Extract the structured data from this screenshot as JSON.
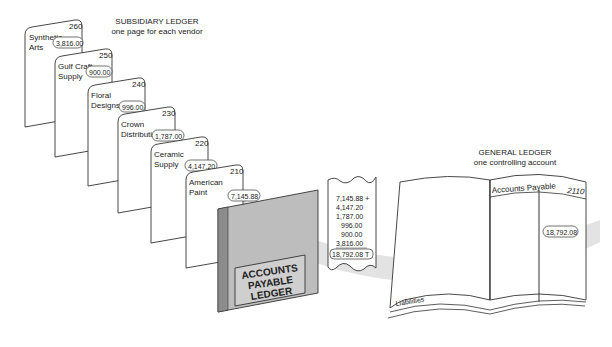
{
  "subsidiary_ledger": {
    "title": "SUBSIDIARY LEDGER",
    "subtitle": "one page for each vendor",
    "pages": [
      {
        "line1": "Synthetic",
        "line2": "Arts",
        "number": "260",
        "amount": "3,816.00"
      },
      {
        "line1": "Gulf Craft",
        "line2": "Supply",
        "number": "250",
        "amount": "900.00"
      },
      {
        "line1": "Floral",
        "line2": "Designs",
        "number": "240",
        "amount": "996.00"
      },
      {
        "line1": "Crown",
        "line2": "Distributing",
        "number": "230",
        "amount": "1,787.00"
      },
      {
        "line1": "Ceramic",
        "line2": "Supply",
        "number": "220",
        "amount": "4,147.20"
      },
      {
        "line1": "American",
        "line2": "Paint",
        "number": "210",
        "amount": "7,145.88"
      }
    ],
    "binder_label": [
      "ACCOUNTS",
      "PAYABLE",
      "LEDGER"
    ]
  },
  "adding_tape": {
    "lines": [
      "7,145.88 +",
      "4,147.20",
      "1,787.00",
      "996.00",
      "900.00",
      "3,816.00"
    ],
    "total": "18,792.08 T"
  },
  "general_ledger": {
    "title": "GENERAL LEDGER",
    "subtitle": "one controlling account",
    "account_name": "Accounts Payable",
    "account_number": "2110",
    "balance": "18,792.08",
    "section_label": "Liabilities"
  },
  "colors": {
    "line": "#333333",
    "flow_band": "#d9d9d9",
    "binder": "#b8b8b8",
    "binder_spine": "#8c8c8c"
  }
}
